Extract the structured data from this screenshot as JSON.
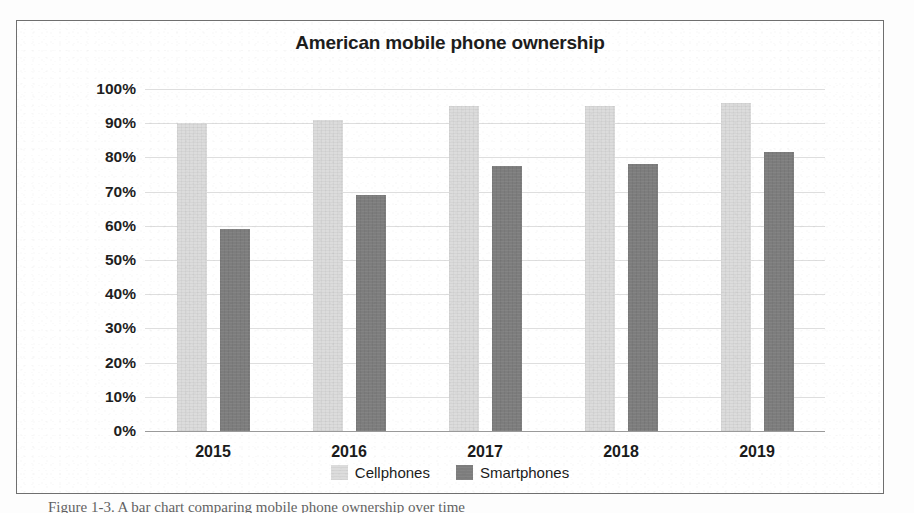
{
  "figure": {
    "title": "American mobile phone ownership",
    "caption_partial": "Figure 1-3. A bar chart comparing mobile phone ownership over time"
  },
  "legend": {
    "position": "bottom",
    "items": [
      {
        "label": "Cellphones",
        "color": "#dcdcdc",
        "swatch": "legend-swatch-cellphones"
      },
      {
        "label": "Smartphones",
        "color": "#7d7d7d",
        "swatch": "legend-swatch-smartphones"
      }
    ]
  },
  "axes": {
    "y_ticks": [
      "0%",
      "10%",
      "20%",
      "30%",
      "40%",
      "50%",
      "60%",
      "70%",
      "80%",
      "90%",
      "100%"
    ],
    "x_ticks": [
      "2015",
      "2016",
      "2017",
      "2018",
      "2019"
    ]
  },
  "chart_data": {
    "type": "bar",
    "title": "American mobile phone ownership",
    "xlabel": "",
    "ylabel": "",
    "categories": [
      "2015",
      "2016",
      "2017",
      "2018",
      "2019"
    ],
    "series": [
      {
        "name": "Cellphones",
        "color": "#dcdcdc",
        "values": [
          90,
          91,
          95,
          95,
          96
        ]
      },
      {
        "name": "Smartphones",
        "color": "#7d7d7d",
        "values": [
          59,
          69,
          77.5,
          78,
          81.5
        ]
      }
    ],
    "ylim": [
      0,
      100
    ],
    "ytick_step": 10,
    "ytick_format": "percent",
    "grid": true,
    "grid_axis": "y",
    "legend_position": "bottom",
    "annotations": []
  }
}
